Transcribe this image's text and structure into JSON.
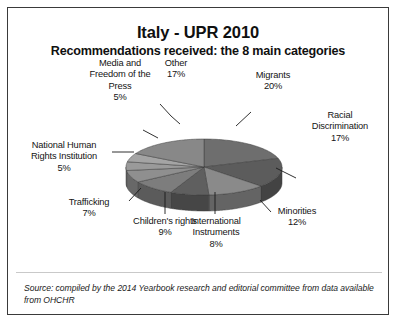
{
  "header": {
    "title": "Italy - UPR 2010",
    "subtitle": "Recommendations received: the 8 main categories"
  },
  "footer": {
    "source": "Source: compiled by the 2014 Yearbook research and editorial committee from data available from OHCHR"
  },
  "chart_data": {
    "type": "pie",
    "title": "Italy - UPR 2010",
    "subtitle": "Recommendations received: the 8 main categories",
    "three_d": true,
    "legend": "none",
    "value_unit": "%",
    "categories": [
      "Migrants",
      "Racial Discrimination",
      "Minorities",
      "International Instruments",
      "Children's rights",
      "Trafficking",
      "National Human Rights Institution",
      "Media and Freedom of the Press",
      "Other"
    ],
    "values": [
      20,
      17,
      12,
      8,
      9,
      7,
      5,
      5,
      17
    ],
    "slices": [
      {
        "label": "Migrants",
        "pct": "20%",
        "value": 20,
        "color": "#6e6e6e",
        "side_color": "#4f4f4f"
      },
      {
        "label": "Racial Discrimination",
        "pct": "17%",
        "value": 17,
        "color": "#5c5c5c",
        "side_color": "#434343"
      },
      {
        "label": "Minorities",
        "pct": "12%",
        "value": 12,
        "color": "#8a8a8a",
        "side_color": "#646464"
      },
      {
        "label": "International Instruments",
        "pct": "8%",
        "value": 8,
        "color": "#5f5f5f",
        "side_color": "#464646"
      },
      {
        "label": "Children's rights",
        "pct": "9%",
        "value": 9,
        "color": "#7d7d7d",
        "side_color": "#5b5b5b"
      },
      {
        "label": "Trafficking",
        "pct": "7%",
        "value": 7,
        "color": "#8f8f8f",
        "side_color": "#686868"
      },
      {
        "label": "National Human Rights Institution",
        "pct": "5%",
        "value": 5,
        "color": "#9a9a9a",
        "side_color": "#6f6f6f"
      },
      {
        "label": "Media and Freedom of the Press",
        "pct": "5%",
        "value": 5,
        "color": "#a4a4a4",
        "side_color": "#767676"
      },
      {
        "label": "Other",
        "pct": "17%",
        "value": 17,
        "color": "#888888",
        "side_color": "#636363"
      }
    ],
    "labels": {
      "media": {
        "line1": "Media and",
        "line2": "Freedom of the",
        "line3": "Press",
        "pct": "5%"
      },
      "other": {
        "line1": "Other",
        "pct": "17%"
      },
      "migrants": {
        "line1": "Migrants",
        "pct": "20%"
      },
      "racial": {
        "line1": "Racial",
        "line2": "Discrimination",
        "pct": "17%"
      },
      "minorities": {
        "line1": "Minorities",
        "pct": "12%"
      },
      "instruments": {
        "line1": "International",
        "line2": "Instruments",
        "pct": "8%"
      },
      "children": {
        "line1": "Children's rights",
        "pct": "9%"
      },
      "trafficking": {
        "line1": "Trafficking",
        "pct": "7%"
      },
      "nhri": {
        "line1": "National Human",
        "line2": "Rights Institution",
        "pct": "5%"
      }
    }
  }
}
